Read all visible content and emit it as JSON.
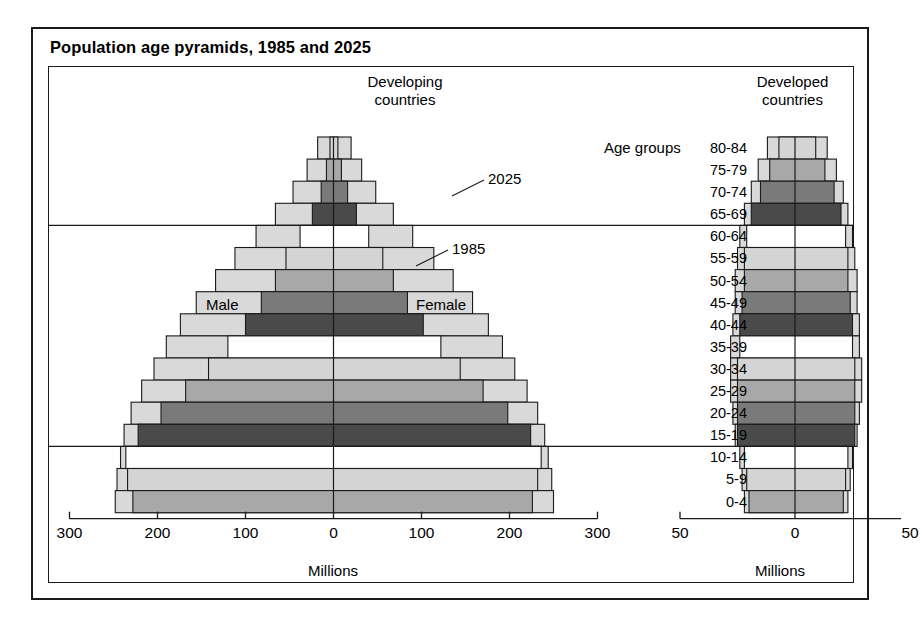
{
  "figure": {
    "title": "Population age pyramids, 1985 and 2025",
    "panels": [
      {
        "id": "developing",
        "header_line1": "Developing",
        "header_line2": "countries"
      },
      {
        "id": "developed",
        "header_line1": "Developed",
        "header_line2": "countries"
      }
    ],
    "annotations": {
      "series_outer": "2025",
      "series_inner": "1985",
      "male": "Male",
      "female": "Female",
      "age_groups_label": "Age groups"
    },
    "axis_name": "Millions"
  },
  "colors": {
    "ink": "#1a1a1a",
    "band_white": "#ffffff",
    "band_light": "#d4d4d4",
    "band_medium": "#a8a8a8",
    "band_dark": "#7a7a7a",
    "band_darkest": "#4a4a4a",
    "outer_fill": "#d9d9d9",
    "page": "#ffffff"
  },
  "chart_data": {
    "type": "bar",
    "subtype": "population-pyramid",
    "title": "Population age pyramids, 1985 and 2025",
    "xlabel": "Millions",
    "ylabel": "Age groups",
    "grid": false,
    "legend_position": "inline-annotation",
    "age_groups": [
      "80-84",
      "75-79",
      "70-74",
      "65-69",
      "60-64",
      "55-59",
      "50-54",
      "45-49",
      "40-44",
      "35-39",
      "30-34",
      "25-29",
      "20-24",
      "15-19",
      "10-14",
      "5-9",
      "0-4"
    ],
    "band_shading_cycle": [
      "band_light",
      "band_medium",
      "band_dark",
      "band_darkest",
      "band_white"
    ],
    "panels": [
      {
        "name": "Developing countries",
        "xlim": [
          -300,
          300
        ],
        "xticks": [
          -300,
          -200,
          -100,
          0,
          100,
          200,
          300
        ],
        "xticklabels": [
          "300",
          "200",
          "100",
          "0",
          "100",
          "200",
          "300"
        ],
        "series": [
          {
            "name": "2025",
            "male": [
              18,
              30,
              46,
              66,
              88,
              112,
              134,
              156,
              174,
              190,
              204,
              218,
              230,
              238,
              242,
              246,
              248
            ],
            "female": [
              20,
              32,
              48,
              68,
              90,
              114,
              136,
              158,
              176,
              192,
              206,
              220,
              232,
              240,
              244,
              248,
              250
            ]
          },
          {
            "name": "1985",
            "male": [
              4,
              8,
              14,
              24,
              38,
              54,
              66,
              82,
              100,
              120,
              142,
              168,
              196,
              222,
              236,
              234,
              228
            ],
            "female": [
              5,
              9,
              16,
              26,
              40,
              56,
              68,
              84,
              102,
              122,
              144,
              170,
              198,
              224,
              236,
              232,
              226
            ]
          }
        ]
      },
      {
        "name": "Developed countries",
        "xlim": [
          -50,
          50
        ],
        "xticks": [
          -50,
          0,
          50
        ],
        "xticklabels": [
          "50",
          "0",
          "50"
        ],
        "series": [
          {
            "name": "2025",
            "male": [
              12,
              16,
              19,
              22,
              24,
              25,
              26,
              26,
              27,
              28,
              28,
              28,
              27,
              26,
              24,
              23,
              22
            ],
            "female": [
              14,
              18,
              21,
              23,
              25,
              26,
              27,
              27,
              28,
              28,
              29,
              29,
              28,
              27,
              25,
              24,
              23
            ]
          },
          {
            "name": "1985",
            "male": [
              7,
              11,
              15,
              19,
              21,
              22,
              22,
              23,
              24,
              24,
              25,
              25,
              25,
              25,
              22,
              21,
              20
            ],
            "female": [
              9,
              13,
              17,
              20,
              22,
              23,
              23,
              24,
              25,
              25,
              26,
              26,
              26,
              26,
              23,
              22,
              21
            ]
          }
        ]
      }
    ],
    "reference_lines": [
      {
        "at_age_group": "65-69",
        "position": "below",
        "note": "retirement-age divider"
      },
      {
        "at_age_group": "15-19",
        "position": "below",
        "note": "working-age divider"
      }
    ]
  }
}
